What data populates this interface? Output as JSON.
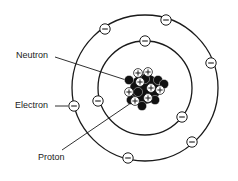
{
  "colors": {
    "line": "#1a1a1a",
    "background": "#ffffff",
    "neutron": "#111111",
    "proton": "#ffffff"
  },
  "labels": {
    "neutron": "Neutron",
    "electron": "Electron",
    "proton": "Proton"
  },
  "symbols": {
    "electron": "−",
    "proton": "+"
  },
  "atom": {
    "center": [
      145,
      88
    ],
    "orbits": [
      {
        "name": "inner-shell",
        "rx": 47,
        "ry": 47,
        "electron_count": 3
      },
      {
        "name": "outer-shell",
        "rx": 73,
        "ry": 73,
        "electron_count": 6
      }
    ],
    "electrons": [
      {
        "shell": "inner",
        "x": 145,
        "y": 41
      },
      {
        "shell": "inner",
        "x": 98,
        "y": 101
      },
      {
        "shell": "inner",
        "x": 182,
        "y": 117
      },
      {
        "shell": "outer",
        "x": 105,
        "y": 29
      },
      {
        "shell": "outer",
        "x": 166,
        "y": 20
      },
      {
        "shell": "outer",
        "x": 211,
        "y": 63
      },
      {
        "shell": "outer",
        "x": 74,
        "y": 106
      },
      {
        "shell": "outer",
        "x": 192,
        "y": 142
      },
      {
        "shell": "outer",
        "x": 128,
        "y": 158
      }
    ],
    "nucleus": {
      "protons": [
        [
          138,
          73
        ],
        [
          148,
          72
        ],
        [
          140,
          82
        ],
        [
          151,
          88
        ],
        [
          160,
          90
        ],
        [
          129,
          92
        ],
        [
          135,
          101
        ],
        [
          148,
          98
        ]
      ],
      "neutrons": [
        [
          129,
          80
        ],
        [
          145,
          79
        ],
        [
          158,
          80
        ],
        [
          138,
          92
        ],
        [
          155,
          100
        ],
        [
          142,
          106
        ],
        [
          164,
          84
        ],
        [
          131,
          100
        ]
      ]
    }
  }
}
